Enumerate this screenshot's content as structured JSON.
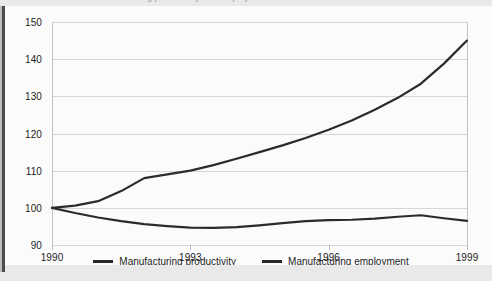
{
  "caption": {
    "text": "Chart 5: Index of manufacturing productivity and employment"
  },
  "colors": {
    "line": "#2b2b2b",
    "grid": "#d6d6d6",
    "axis": "#c2c2c2",
    "text": "#1d1d1d",
    "plot_background": "#fbfbfb",
    "page_background": "#e9e9e9",
    "frame": "#4a4a4a"
  },
  "legend": {
    "position": "bottom-center",
    "items": [
      {
        "label": "Manufacturing productivity",
        "swatch": "line-swatch"
      },
      {
        "label": "Manufacturing employment",
        "swatch": "line-swatch"
      }
    ]
  },
  "chart_data": {
    "type": "line",
    "title": "",
    "xlabel": "",
    "ylabel": "",
    "xlim": [
      1990,
      1999
    ],
    "ylim": [
      90,
      150
    ],
    "grid": true,
    "legend_position": "bottom-center",
    "y_ticks": [
      90,
      100,
      110,
      120,
      130,
      140,
      150
    ],
    "x_ticks": [
      1990,
      1993,
      1996,
      1999
    ],
    "x_tick_labels": [
      "1990",
      "1993",
      "1996",
      "1999"
    ],
    "y_tick_labels": [
      "90",
      "100",
      "110",
      "120",
      "130",
      "140",
      "150"
    ],
    "x": [
      1990,
      1990.5,
      1991,
      1991.5,
      1992,
      1992.5,
      1993,
      1993.5,
      1994,
      1994.5,
      1995,
      1995.5,
      1996,
      1996.5,
      1997,
      1997.5,
      1998,
      1998.5,
      1999
    ],
    "series": [
      {
        "name": "Manufacturing productivity",
        "values": [
          100.0,
          100.6,
          101.8,
          104.5,
          108.0,
          109.0,
          110.0,
          111.5,
          113.2,
          115.0,
          116.8,
          118.8,
          121.0,
          123.5,
          126.4,
          129.6,
          133.4,
          138.8,
          145.0
        ]
      },
      {
        "name": "Manufacturing employment",
        "values": [
          100.0,
          98.6,
          97.4,
          96.4,
          95.6,
          95.1,
          94.7,
          94.6,
          94.8,
          95.3,
          95.9,
          96.4,
          96.7,
          96.8,
          97.1,
          97.6,
          98.0,
          97.2,
          96.5
        ]
      }
    ]
  }
}
